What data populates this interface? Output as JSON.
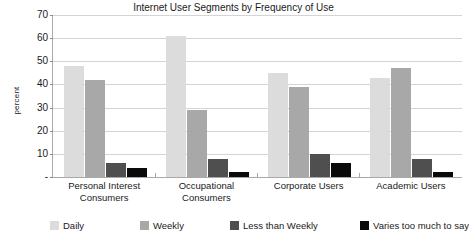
{
  "chart_data": {
    "type": "bar",
    "title": "Internet User Segments by Frequency of Use",
    "xlabel": "",
    "ylabel": "percent",
    "ylim": [
      0,
      70
    ],
    "ytick_labels": [
      "70",
      "60",
      "50",
      "40",
      "30",
      "20",
      "10",
      "-"
    ],
    "ytick_values": [
      70,
      60,
      50,
      40,
      30,
      20,
      10,
      0
    ],
    "grid": true,
    "legend_position": "bottom",
    "categories": [
      "Personal Interest Consumers",
      "Occupational Consumers",
      "Corporate Users",
      "Academic Users"
    ],
    "category_lines": [
      [
        "Personal Interest",
        "Consumers"
      ],
      [
        "Occupational",
        "Consumers"
      ],
      [
        "Corporate Users",
        ""
      ],
      [
        "Academic Users",
        ""
      ]
    ],
    "series": [
      {
        "name": "Daily",
        "color": "#dcdcdc",
        "values": [
          48,
          61,
          45,
          43
        ]
      },
      {
        "name": "Weekly",
        "color": "#a8a8a8",
        "values": [
          42,
          29,
          39,
          47
        ]
      },
      {
        "name": "Less than Weekly",
        "color": "#4f4f4f",
        "values": [
          6,
          8,
          10,
          8
        ]
      },
      {
        "name": "Varies too much to say",
        "color": "#0a0a0a",
        "values": [
          4,
          2,
          6,
          2
        ]
      }
    ]
  }
}
